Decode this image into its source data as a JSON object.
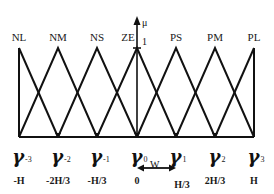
{
  "figure": {
    "type": "fuzzy-membership-functions",
    "axis": {
      "y_label": "μ",
      "y_tick": "1",
      "w_label": "W"
    },
    "sets": [
      {
        "name": "NL",
        "center_x": 19
      },
      {
        "name": "NM",
        "center_x": 58
      },
      {
        "name": "NS",
        "center_x": 97
      },
      {
        "name": "ZE",
        "center_x": 137
      },
      {
        "name": "PS",
        "center_x": 176
      },
      {
        "name": "PM",
        "center_x": 215
      },
      {
        "name": "PL",
        "center_x": 254
      }
    ],
    "gammas": [
      {
        "symbol": "γ",
        "sub": "-3",
        "value": "-H"
      },
      {
        "symbol": "γ",
        "sub": "-2",
        "value": "-2H/3"
      },
      {
        "symbol": "γ",
        "sub": "-1",
        "value": "-H/3"
      },
      {
        "symbol": "γ",
        "sub": "0",
        "value": "0"
      },
      {
        "symbol": "γ",
        "sub": "1",
        "value": "H/3"
      },
      {
        "symbol": "γ",
        "sub": "2",
        "value": "2H/3"
      },
      {
        "symbol": "γ",
        "sub": "3",
        "value": "H"
      }
    ],
    "colors": {
      "line": "#111111",
      "background": "#ffffff"
    }
  }
}
